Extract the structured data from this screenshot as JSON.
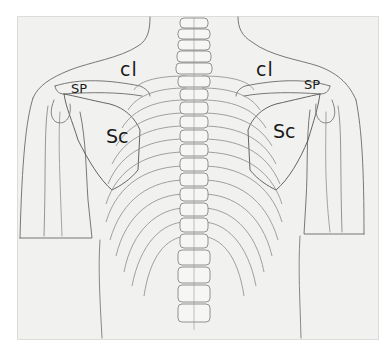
{
  "figure": {
    "type": "anatomical-illustration",
    "labels": {
      "left_clavicle": "cl",
      "right_clavicle": "cl",
      "left_spine": "SP",
      "right_spine": "SP",
      "left_scapula": "Sc",
      "right_scapula": "Sc"
    },
    "colors": {
      "paper": "#f1f1ef",
      "line": "#555555",
      "text": "#1a1a1a"
    }
  }
}
